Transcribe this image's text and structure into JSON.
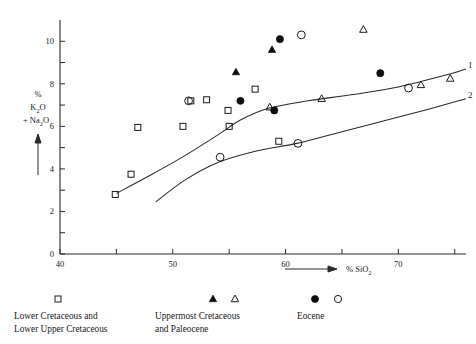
{
  "chart_data": {
    "type": "scatter",
    "title": "",
    "xlabel": "% SiO2",
    "ylabel": "% K2O + Na2O",
    "xlim": [
      40,
      76
    ],
    "ylim": [
      0,
      11
    ],
    "xticks": [
      40,
      45,
      50,
      55,
      60,
      65,
      70,
      75
    ],
    "xticklabels": [
      "40",
      "",
      "50",
      "",
      "60",
      "",
      "70",
      ""
    ],
    "yticks": [
      0,
      1,
      2,
      3,
      4,
      5,
      6,
      7,
      8,
      9,
      10
    ],
    "yticklabels": [
      "0",
      "",
      "2",
      "",
      "4",
      "",
      "6",
      "",
      "8",
      "",
      "10"
    ],
    "grid": false,
    "legend_position": "below-axes",
    "series": [
      {
        "name": "Lower Cretaceous and Lower Upper Cretaceous",
        "marker": "open-square",
        "points": [
          {
            "x": 44.9,
            "y": 2.8
          },
          {
            "x": 46.3,
            "y": 3.75
          },
          {
            "x": 50.9,
            "y": 6.0
          },
          {
            "x": 46.9,
            "y": 5.95
          },
          {
            "x": 53.0,
            "y": 7.25
          },
          {
            "x": 54.9,
            "y": 6.75
          },
          {
            "x": 55.0,
            "y": 6.0
          },
          {
            "x": 57.3,
            "y": 7.75
          },
          {
            "x": 59.4,
            "y": 5.3
          },
          {
            "x": 51.6,
            "y": 7.2
          }
        ]
      },
      {
        "name": "Uppermost Cretaceous and Paleocene",
        "marker_filled": "filled-triangle",
        "marker_open": "open-triangle",
        "points_filled": [
          {
            "x": 55.6,
            "y": 8.55
          },
          {
            "x": 58.8,
            "y": 9.6
          }
        ],
        "points_open": [
          {
            "x": 58.6,
            "y": 6.9
          },
          {
            "x": 66.9,
            "y": 10.55
          },
          {
            "x": 63.2,
            "y": 7.3
          },
          {
            "x": 72.0,
            "y": 7.95
          },
          {
            "x": 74.6,
            "y": 8.25
          }
        ]
      },
      {
        "name": "Eocene",
        "marker_filled": "filled-circle",
        "marker_open": "open-circle",
        "points_filled": [
          {
            "x": 56.0,
            "y": 7.2
          },
          {
            "x": 59.5,
            "y": 10.1
          },
          {
            "x": 59.0,
            "y": 6.75
          },
          {
            "x": 68.4,
            "y": 8.5
          }
        ],
        "points_open": [
          {
            "x": 51.4,
            "y": 7.2
          },
          {
            "x": 61.4,
            "y": 10.3
          },
          {
            "x": 54.2,
            "y": 4.55
          },
          {
            "x": 61.1,
            "y": 5.2
          },
          {
            "x": 70.9,
            "y": 7.8
          }
        ]
      }
    ],
    "curves": [
      {
        "label": "1",
        "name": "upper-boundary-curve",
        "points": [
          {
            "x": 45.0,
            "y": 2.85
          },
          {
            "x": 48.0,
            "y": 3.7
          },
          {
            "x": 51.0,
            "y": 4.6
          },
          {
            "x": 54.0,
            "y": 5.6
          },
          {
            "x": 56.0,
            "y": 6.3
          },
          {
            "x": 58.5,
            "y": 6.85
          },
          {
            "x": 62.0,
            "y": 7.2
          },
          {
            "x": 66.0,
            "y": 7.5
          },
          {
            "x": 70.0,
            "y": 7.85
          },
          {
            "x": 74.5,
            "y": 8.45
          },
          {
            "x": 76.0,
            "y": 8.7
          }
        ]
      },
      {
        "label": "2",
        "name": "lower-boundary-curve",
        "points": [
          {
            "x": 48.5,
            "y": 2.45
          },
          {
            "x": 51.0,
            "y": 3.45
          },
          {
            "x": 54.0,
            "y": 4.3
          },
          {
            "x": 57.5,
            "y": 4.85
          },
          {
            "x": 61.0,
            "y": 5.2
          },
          {
            "x": 65.0,
            "y": 5.75
          },
          {
            "x": 69.0,
            "y": 6.3
          },
          {
            "x": 73.0,
            "y": 6.85
          },
          {
            "x": 76.0,
            "y": 7.3
          }
        ]
      }
    ]
  },
  "axes": {
    "y_label_line1": "%",
    "y_label_line2": "K",
    "y_label_line2_sub": "2",
    "y_label_line2_end": "O",
    "y_label_line3_pre": "+ Na",
    "y_label_line3_sub": "2",
    "y_label_line3_end": "O",
    "x_label_pre": "% SiO",
    "x_label_sub": "2",
    "xticklabels": [
      "40",
      "50",
      "60",
      "70"
    ],
    "yticklabels": [
      "0",
      "2",
      "4",
      "6",
      "8",
      "10"
    ]
  },
  "curve_labels": {
    "upper": "1",
    "lower": "2"
  },
  "legend": {
    "groups": [
      {
        "id": "lower-cretaceous",
        "line1": "Lower Cretaceous and",
        "line2": "Lower Upper Cretaceous",
        "markers": [
          "open-square"
        ]
      },
      {
        "id": "uppermost-cretaceous-paleocene",
        "line1": "Uppermost Cretaceous",
        "line2": "and Paleocene",
        "markers": [
          "filled-triangle",
          "open-triangle"
        ]
      },
      {
        "id": "eocene",
        "line1": "Eocene",
        "line2": "",
        "markers": [
          "filled-circle",
          "open-circle"
        ]
      }
    ]
  },
  "colors": {
    "ink": "#1a1a1a",
    "axis": "#2b2b2b",
    "background": "#ffffff"
  }
}
